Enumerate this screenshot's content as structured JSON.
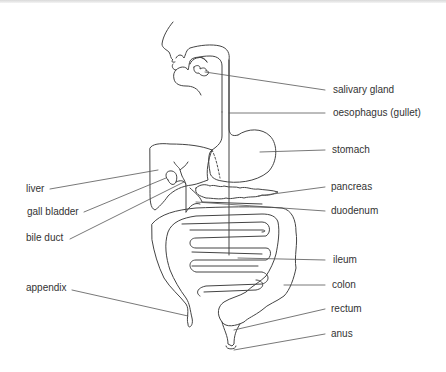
{
  "diagram": {
    "line_color": "#444444",
    "text_color": "#333333",
    "labels_right": [
      {
        "id": "salivary-gland",
        "text": "salivary gland",
        "x": 333,
        "y": 83
      },
      {
        "id": "oesophagus",
        "text": "oesophagus (gullet)",
        "x": 333,
        "y": 108
      },
      {
        "id": "stomach",
        "text": "stomach",
        "x": 332,
        "y": 144
      },
      {
        "id": "pancreas",
        "text": "pancreas",
        "x": 331,
        "y": 181
      },
      {
        "id": "duodenum",
        "text": "duodenum",
        "x": 331,
        "y": 205
      },
      {
        "id": "ileum",
        "text": "ileum",
        "x": 333,
        "y": 254
      },
      {
        "id": "colon",
        "text": "colon",
        "x": 332,
        "y": 278
      },
      {
        "id": "rectum",
        "text": "rectum",
        "x": 331,
        "y": 303
      },
      {
        "id": "anus",
        "text": "anus",
        "x": 331,
        "y": 328
      }
    ],
    "labels_left": [
      {
        "id": "liver",
        "text": "liver",
        "x": 26,
        "y": 183
      },
      {
        "id": "gall-bladder",
        "text": "gall bladder",
        "x": 27,
        "y": 207
      },
      {
        "id": "bile-duct",
        "text": "bile duct",
        "x": 26,
        "y": 233
      },
      {
        "id": "appendix",
        "text": "appendix",
        "x": 26,
        "y": 282
      }
    ]
  }
}
